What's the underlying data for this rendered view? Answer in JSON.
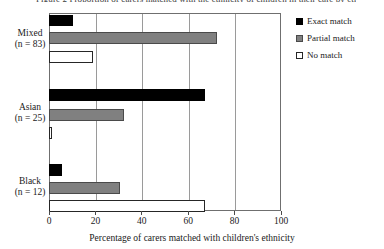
{
  "title_clipped": "Figure 2 Proportion of carers matched with the ethnicity of children in their care by ethnic group",
  "legend": {
    "position": "top-right",
    "entries": [
      {
        "label": "Exact match",
        "key": "exact",
        "color": "#000000",
        "swatch": "filled-black-square-icon"
      },
      {
        "label": "Partial match",
        "key": "partial",
        "color": "#808080",
        "swatch": "filled-gray-square-icon"
      },
      {
        "label": "No match",
        "key": "nomatch",
        "color": "#ffffff",
        "swatch": "outlined-white-square-icon"
      }
    ]
  },
  "axes": {
    "x": {
      "title": "Percentage of carers matched with children's ethnicity",
      "ticks": [
        0,
        20,
        40,
        60,
        80,
        100
      ],
      "tick_labels": [
        "0",
        "20",
        "40",
        "60",
        "80",
        "100"
      ],
      "min": 0,
      "max": 100
    },
    "y": {
      "categories": [
        {
          "name": "Mixed",
          "n_label": "(n = 83)",
          "n": 83
        },
        {
          "name": "Asian",
          "n_label": "(n = 25)",
          "n": 25
        },
        {
          "name": "Black",
          "n_label": "(n = 12)",
          "n": 12
        }
      ]
    }
  },
  "chart_data": {
    "type": "bar",
    "orientation": "horizontal",
    "title": "Figure 2 Proportion of carers matched with the ethnicity of children in their care by ethnic group",
    "xlabel": "Percentage of carers matched with children's ethnicity",
    "ylabel": "",
    "xlim": [
      0,
      100
    ],
    "xticks": [
      0,
      20,
      40,
      60,
      80,
      100
    ],
    "grid": "vertical",
    "legend_position": "top-right",
    "categories": [
      "Mixed (n = 83)",
      "Asian (n = 25)",
      "Black (n = 12)"
    ],
    "series": [
      {
        "name": "Exact match",
        "color": "#000000",
        "values": [
          10,
          67,
          5
        ]
      },
      {
        "name": "Partial match",
        "color": "#808080",
        "values": [
          72,
          32,
          30
        ]
      },
      {
        "name": "No match",
        "color": "#ffffff",
        "values": [
          18.5,
          1,
          67
        ]
      }
    ]
  },
  "geometry": {
    "plot_left_px": 49,
    "plot_top_px": 13,
    "plot_width_px": 232,
    "plot_height_px": 198,
    "bars": [
      {
        "group": 0,
        "series": "exact",
        "top_px": 14,
        "height_px": 11,
        "value": 10
      },
      {
        "group": 0,
        "series": "partial",
        "top_px": 31,
        "height_px": 12,
        "value": 72
      },
      {
        "group": 0,
        "series": "nomatch",
        "top_px": 50,
        "height_px": 12,
        "value": 18.5
      },
      {
        "group": 1,
        "series": "exact",
        "top_px": 88,
        "height_px": 12,
        "value": 67
      },
      {
        "group": 1,
        "series": "partial",
        "top_px": 108,
        "height_px": 12,
        "value": 32
      },
      {
        "group": 1,
        "series": "nomatch",
        "top_px": 126,
        "height_px": 12,
        "value": 1
      },
      {
        "group": 2,
        "series": "exact",
        "top_px": 163,
        "height_px": 12,
        "value": 5
      },
      {
        "group": 2,
        "series": "partial",
        "top_px": 181,
        "height_px": 12,
        "value": 30
      },
      {
        "group": 2,
        "series": "nomatch",
        "top_px": 199,
        "height_px": 12,
        "value": 67
      }
    ],
    "category_label_tops_px": [
      28,
      102,
      176
    ]
  }
}
